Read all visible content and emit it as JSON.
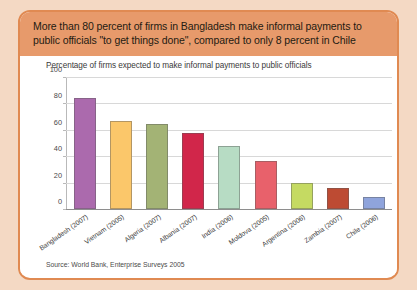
{
  "header": {
    "text": "More than 80 percent of firms in Bangladesh make informal payments to public officials \"to get things done\", compared to only 8 percent in Chile",
    "background_color": "#e79a6b"
  },
  "frame": {
    "border_color": "#e08a52",
    "page_background": "#f4d9c4",
    "panel_background": "#ffffff"
  },
  "source": {
    "text": "Source: World Bank, Enterprise Surveys 2005"
  },
  "chart_data": {
    "type": "bar",
    "title": "Percentage of firms expected to make informal payments to public officials",
    "xlabel": "",
    "ylabel": "",
    "ylim": [
      0,
      100
    ],
    "yticks": [
      0,
      20,
      40,
      60,
      80,
      100
    ],
    "ytick_labels": [
      "0",
      "20",
      "40",
      "60",
      "80",
      "100"
    ],
    "grid": true,
    "legend": "none",
    "categories": [
      "Bangladesh (2007)",
      "Vietnam (2005)",
      "Algeria (2007)",
      "Albania (2007)",
      "India (2006)",
      "Moldova (2005)",
      "Argentina (2006)",
      "Zambia (2007)",
      "Chile (2006)"
    ],
    "values": [
      85,
      67,
      65,
      58,
      48,
      37,
      20,
      16,
      9
    ],
    "colors": [
      "#ab6aad",
      "#fbc濃"
    ],
    "bar_colors": [
      "#ab6aad",
      "#fbc76a",
      "#a3b375",
      "#d1264a",
      "#b7dcc4",
      "#e8616b",
      "#c5da62",
      "#bd4b33",
      "#8fa4dc"
    ]
  }
}
